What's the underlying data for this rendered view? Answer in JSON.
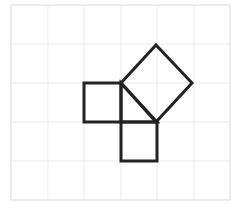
{
  "diagram": {
    "canvas": {
      "width": 241,
      "height": 210
    },
    "grid": {
      "x_lines": [
        11,
        48,
        84,
        121,
        157,
        194,
        230
      ],
      "y_lines": [
        5,
        44,
        83,
        122,
        161,
        200
      ],
      "columns": 6,
      "rows": 5,
      "line_color": "#ececec",
      "border_color": "#e6e6e6"
    },
    "stroke": {
      "color": "#222222",
      "width": 3
    },
    "shapes": [
      {
        "id": "left-square",
        "points": [
          [
            84,
            83
          ],
          [
            121,
            83
          ],
          [
            121,
            122
          ],
          [
            84,
            122
          ]
        ]
      },
      {
        "id": "bottom-square",
        "points": [
          [
            121,
            122
          ],
          [
            157,
            122
          ],
          [
            157,
            161
          ],
          [
            121,
            161
          ]
        ]
      },
      {
        "id": "hypotenuse-square",
        "points": [
          [
            156,
            45
          ],
          [
            192,
            83
          ],
          [
            156,
            122
          ],
          [
            121,
            83
          ]
        ]
      },
      {
        "id": "triangle",
        "points": [
          [
            121,
            83
          ],
          [
            157,
            122
          ],
          [
            121,
            122
          ]
        ]
      }
    ]
  }
}
